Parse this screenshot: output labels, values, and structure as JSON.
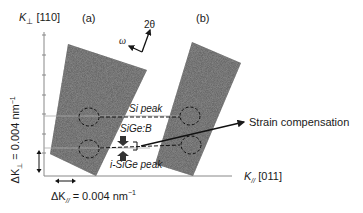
{
  "figure": {
    "y_axis_label": "K",
    "y_axis_subscript": "⊥",
    "y_axis_direction": "[110]",
    "x_axis_label": "K",
    "x_axis_subscript": "//",
    "x_axis_direction": "[011]",
    "panel_a_label": "(a)",
    "panel_b_label": "(b)",
    "scan_2theta": "2θ",
    "scan_omega": "ω",
    "si_peak": "Si peak",
    "sige_b": "SiGe:B",
    "isige_peak": "i-SiGe peak",
    "strain_comp": "Strain compensation",
    "dk_perp_label": "ΔK",
    "dk_perp_sub": "⊥",
    "dk_perp_value": " = 0.004 nm",
    "dk_par_label": "ΔK",
    "dk_par_sub": "//",
    "dk_par_value": " = 0.004 nm",
    "unit_exp": "−1"
  },
  "colors": {
    "map_fill": "#6e6e6e",
    "axis": "#888888",
    "text": "#1a1a1a"
  }
}
